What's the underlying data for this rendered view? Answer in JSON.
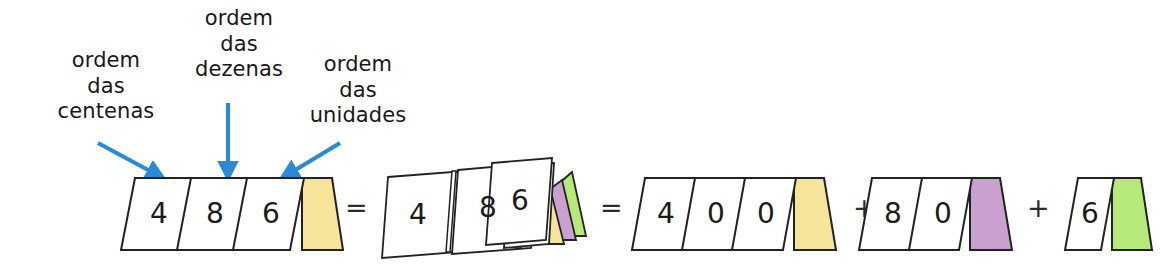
{
  "diagram": {
    "language": "pt-BR",
    "labels": {
      "hundreds": "ordem\ndas\ncentenas",
      "tens": "ordem\ndas\ndezenas",
      "units": "ordem\ndas\nunidades"
    },
    "operators": {
      "equals_1": "=",
      "equals_2": "=",
      "plus_1": "+",
      "plus_2": "+"
    },
    "colors": {
      "arrow_blue": "#2b8ad8",
      "tab_hundreds_yellow": "#f5e49a",
      "tab_tens_purple": "#c9a0d0",
      "tab_units_green": "#b6e87a",
      "card_fill": "#ffffff",
      "card_stroke": "#222222",
      "text": "#181818"
    },
    "groups": [
      {
        "id": "group-486",
        "name": "card-group-486",
        "digits": [
          "4",
          "8",
          "6"
        ],
        "tabs": [
          "yellow"
        ]
      },
      {
        "id": "group-stacked",
        "name": "card-group-stacked",
        "digits": [
          "4",
          "8",
          "6"
        ],
        "tabs": [
          "yellow",
          "purple",
          "green"
        ]
      },
      {
        "id": "group-400",
        "name": "card-group-400",
        "digits": [
          "4",
          "0",
          "0"
        ],
        "tabs": [
          "yellow"
        ]
      },
      {
        "id": "group-80",
        "name": "card-group-80",
        "digits": [
          "8",
          "0"
        ],
        "tabs": [
          "purple"
        ]
      },
      {
        "id": "group-6",
        "name": "card-group-6",
        "digits": [
          "6"
        ],
        "tabs": [
          "green"
        ]
      }
    ]
  }
}
